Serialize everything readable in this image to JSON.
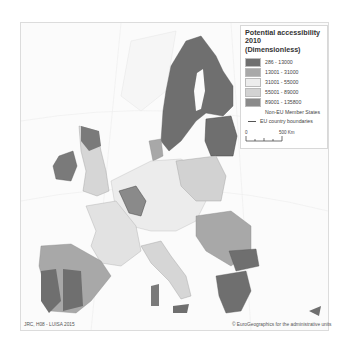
{
  "legend": {
    "title_line1": "Potential accessibility",
    "title_line2": "2010",
    "title_line3": "(Dimensionless)",
    "classes": [
      {
        "label": "286 - 13000",
        "color": "#6f6f6f"
      },
      {
        "label": "13001 - 31000",
        "color": "#a8a8a8"
      },
      {
        "label": "31001 - 55000",
        "color": "#ececec"
      },
      {
        "label": "55001 - 89000",
        "color": "#d2d2d2"
      },
      {
        "label": "89001 - 135800",
        "color": "#8a8a8a"
      }
    ],
    "non_eu_label": "Non-EU Member States",
    "boundary_label": "EU country boundaries",
    "scale_start": "0",
    "scale_end": "500 Km"
  },
  "credits": {
    "left": "JRC, H08 - LUISA 2015",
    "right": "© EuroGeographics for the administrative units"
  }
}
